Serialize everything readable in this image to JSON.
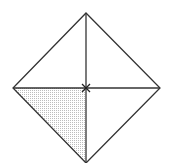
{
  "diagram": {
    "colors": {
      "stroke": "#333333",
      "shade": "#d8d8d8",
      "background": "#ffffff"
    },
    "vertices": {
      "top": [
        86,
        13
      ],
      "right": [
        160,
        88
      ],
      "bottom": [
        86,
        163
      ],
      "left": [
        13,
        88
      ],
      "center": [
        86,
        88
      ]
    },
    "shaded_region": "lower-left triangle"
  }
}
